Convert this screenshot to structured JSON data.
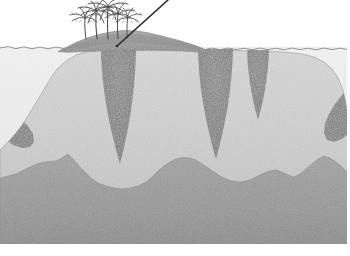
{
  "figure": {
    "title": "Geologic cross-section of a carbonate atoll island",
    "caption": "",
    "width": 350,
    "height": 256
  },
  "palette": {
    "sky": "#ffffff",
    "sea_water": "#eeeeee",
    "sea_surface_line": "#8a8a8a",
    "island_cap": "#9b9b9b",
    "island_cap_dark": "#8f8f8f",
    "carbonate_platform": "#d2d2d2",
    "dissolution_pipe": "#7e7e7e",
    "basement": "#9a9a9a",
    "basement_dark": "#8e8e8e",
    "outline": "#6d6d6d",
    "vegetation": "#4a4a4a",
    "borehole": "#2b2b2b",
    "frame": "#9a9a9a"
  },
  "layers": [
    {
      "id": "sky",
      "name": "sky",
      "label": "Sky / atmosphere",
      "color": "#ffffff"
    },
    {
      "id": "sea",
      "name": "sea-water",
      "label": "Sea water",
      "color": "#eeeeee",
      "sea_level_y": 48
    },
    {
      "id": "island-cap",
      "name": "island-cap",
      "label": "Emergent island cap",
      "color": "#9b9b9b",
      "extent_x": [
        58,
        205
      ],
      "crest_y": 30
    },
    {
      "id": "platform",
      "name": "carbonate-platform",
      "label": "Carbonate platform",
      "color": "#d2d2d2"
    },
    {
      "id": "pipes",
      "name": "dissolution-pipes",
      "label": "Dissolution pipes / karst infill",
      "color": "#7e7e7e",
      "count": 3
    },
    {
      "id": "wedges",
      "name": "flank-wedges",
      "label": "Dark flank wedge deposits",
      "color": "#7e7e7e",
      "count": 2
    },
    {
      "id": "basement",
      "name": "volcanic-basement",
      "label": "Volcanic basement",
      "color": "#9a9a9a"
    }
  ],
  "features": {
    "palms": {
      "name": "palm-tree-cluster",
      "label": "Palm trees",
      "count": 5,
      "trunk_bases_x": [
        86,
        97,
        108,
        118,
        127
      ],
      "base_y": 39,
      "heights": [
        24,
        30,
        33,
        27,
        22
      ]
    },
    "borehole": {
      "name": "borehole-line",
      "label": "Borehole / drill string",
      "top": [
        168,
        0
      ],
      "bottom": [
        117,
        46
      ],
      "width": 1.6
    },
    "pipes": [
      {
        "name": "dissolution-pipe-1",
        "top_x": [
          101,
          136
        ],
        "top_y": 50,
        "tip_x": 120,
        "tip_y": 164,
        "waist": 6
      },
      {
        "name": "dissolution-pipe-2",
        "top_x": [
          198,
          233
        ],
        "top_y": 49,
        "tip_x": 216,
        "tip_y": 159,
        "waist": 6
      },
      {
        "name": "dissolution-pipe-3",
        "top_x": [
          247,
          269
        ],
        "top_y": 50,
        "tip_x": 258,
        "tip_y": 120,
        "waist": 4
      }
    ],
    "wedges": [
      {
        "name": "flank-wedge-left",
        "side": "left",
        "x_range": [
          0,
          36
        ],
        "y_range": [
          104,
          146
        ]
      },
      {
        "name": "flank-wedge-right",
        "side": "right",
        "x_range": [
          318,
          345
        ],
        "y_range": [
          88,
          140
        ]
      }
    ]
  },
  "geometry": {
    "sea_surface_path": "M0,48 L8,46.6 L16,48.6 L24,46.8 L32,48.8 L40,47 L48,48.8 L56,47 L64,48.6 L72,47.2 L80,48.8 L88,47 L96,48.6 L104,47 L112,48.8 L120,47 L128,48.6 L136,47.2 L144,48.8 L152,47 L160,48.6 L168,47 L176,48.8 L184,47 L192,48.6 L200,47.2 L208,48.8 L216,47 L224,48.6 L232,47 L240,48.8 L248,47 L256,48.6 L264,47.2 L272,48.8 L280,47 L288,48.6 L296,47 L304,48.8 L312,47 L320,48.6 L328,47.2 L336,48.8 L344,47 L346,48",
    "island_cap_path": "M58,51 L66,47 L76,42 L88,37.5 L100,34 L112,31.6 L124,30.4 L136,30.8 L148,32.6 L160,35.4 L170,38 L180,40.6 L190,43.6 L198,46.4 L204,49 L204,52.5 L196,51.6 L184,50.8 L170,50.4 L154,50.2 L138,50.2 L120,50.4 L100,50.8 L82,51.4 L68,52 Z",
    "platform_top_path": "M0,150 L4,146 L10,140 L16,133 L22,125 L28,116 L34,106 L40,96 L46,86 L52,76 L58,68 L66,61 L76,55 L88,51.6 L104,50.2 L124,49.6 L146,49.6 L168,49.8 L190,50.2 L212,50.4 L236,50.6 L260,51 L284,52 L302,54 L314,57 L324,62 L332,69 L338,78 L343,90 L346,104 L348,120 L349,138 L349,206 L0,206 Z",
    "basement_path": "M0,178 L8,176 L16,174 L24,170 L32,166 L40,163 L48,161.5 L56,161 L62,158 L68,154 L74,160 L80,167 L86,173 L92,179 L98,183 L106,186 L114,188 L122,189 L130,188 L138,186 L146,182 L152,177 L158,171 L164,166 L170,162 L176,159 L182,157.5 L190,158 L196,160 L202,164 L208,168 L214,172 L220,176 L226,179 L232,181 L240,182 L246,181 L252,179 L258,176 L264,173 L270,171 L276,170 L282,172 L288,175 L294,177 L300,174 L306,169 L312,164 L318,159 L324,156 L330,158 L336,162 L342,167 L346,171 L350,174 L350,244 L0,244 Z",
    "frame": {
      "right_margin": 4,
      "bottom_margin": 12
    }
  }
}
